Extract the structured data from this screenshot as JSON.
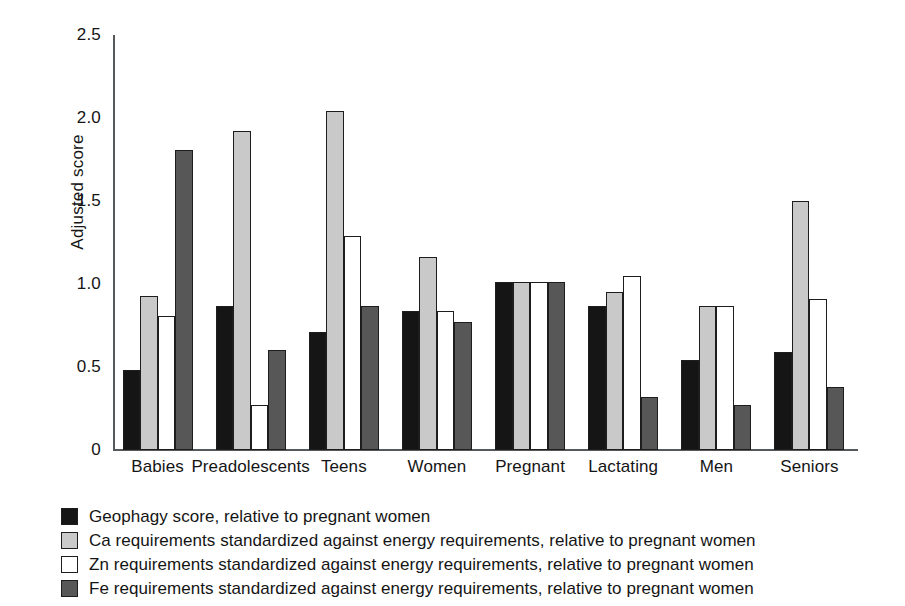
{
  "chart_data": {
    "type": "bar",
    "title": "",
    "subtitle": "",
    "xlabel": "",
    "ylabel": "Adjusted score",
    "ylim": [
      0,
      2.5
    ],
    "ytick_labels": [
      "0",
      "0.5",
      "1.0",
      "1.5",
      "2.0",
      "2.5"
    ],
    "ytick_values": [
      0,
      0.5,
      1.0,
      1.5,
      2.0,
      2.5
    ],
    "grid": false,
    "legend_position": "below-left",
    "categories": [
      "Babies",
      "Preadolescents",
      "Teens",
      "Women",
      "Pregnant",
      "Lactating",
      "Men",
      "Seniors"
    ],
    "series": [
      {
        "name": "Geophagy score, relative to pregnant women",
        "color": "#151515",
        "values": [
          0.48,
          0.87,
          0.71,
          0.84,
          1.01,
          0.87,
          0.54,
          0.59
        ]
      },
      {
        "name": "Ca requirements standardized against energy requirements, relative to pregnant women",
        "color": "#c9c9c9",
        "values": [
          0.93,
          1.92,
          2.04,
          1.16,
          1.01,
          0.95,
          0.87,
          1.5
        ]
      },
      {
        "name": "Zn requirements standardized against energy requirements, relative to pregnant women",
        "color": "#ffffff",
        "values": [
          0.81,
          0.27,
          1.29,
          0.84,
          1.01,
          1.05,
          0.87,
          0.91
        ]
      },
      {
        "name": "Fe requirements standardized against energy requirements, relative to pregnant women",
        "color": "#575757",
        "values": [
          1.81,
          0.6,
          0.87,
          0.77,
          1.01,
          0.32,
          0.27,
          0.38
        ]
      }
    ]
  }
}
